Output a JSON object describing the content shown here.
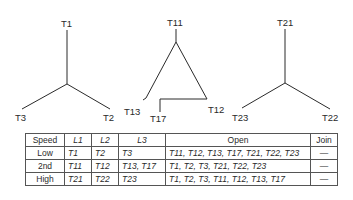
{
  "diagrams": [
    {
      "name": "wye-low",
      "labels": [
        "T1",
        "T2",
        "T3"
      ]
    },
    {
      "name": "delta-2nd",
      "labels": [
        "T11",
        "T12",
        "T13",
        "T17"
      ]
    },
    {
      "name": "wye-high",
      "labels": [
        "T21",
        "T22",
        "T23"
      ]
    }
  ],
  "table": {
    "headers": [
      "Speed",
      "L1",
      "L2",
      "L3",
      "Open",
      "Join"
    ],
    "rows": [
      {
        "speed": "Low",
        "l1": "T1",
        "l2": "T2",
        "l3": "T3",
        "open": "T11, T12, T13, T17, T21, T22, T23",
        "join": "—"
      },
      {
        "speed": "2nd",
        "l1": "T11",
        "l2": "T12",
        "l3": "T13, T17",
        "open": "T1, T2, T3, T21, T22, T23",
        "join": "—"
      },
      {
        "speed": "High",
        "l1": "T21",
        "l2": "T22",
        "l3": "T23",
        "open": "T1, T2, T3, T11, T12, T13, T17",
        "join": "—"
      }
    ]
  }
}
